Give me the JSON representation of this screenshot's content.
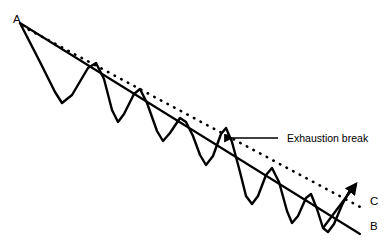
{
  "figure": {
    "kind": "technical-analysis-trendline-diagram",
    "background_color": "#ffffff",
    "stroke_color": "#000000",
    "width": 392,
    "height": 240
  },
  "labels": {
    "apex": "A",
    "trendline_end": "B",
    "parallel_line_end": "C",
    "annotation": "Exhaustion break"
  },
  "chart_data": {
    "type": "line",
    "title": "",
    "xlabel": "",
    "ylabel": "",
    "grid": false,
    "legend": "none",
    "xlim": [
      0,
      392
    ],
    "ylim": [
      0,
      240
    ],
    "series": [
      {
        "name": "price-wave",
        "role": "zigzag price action",
        "style": "solid",
        "points": [
          [
            20,
            23
          ],
          [
            40,
            62
          ],
          [
            55,
            92
          ],
          [
            62,
            103
          ],
          [
            72,
            95
          ],
          [
            88,
            68
          ],
          [
            96,
            63
          ],
          [
            104,
            79
          ],
          [
            112,
            110
          ],
          [
            118,
            122
          ],
          [
            124,
            114
          ],
          [
            134,
            94
          ],
          [
            140,
            89
          ],
          [
            147,
            103
          ],
          [
            157,
            131
          ],
          [
            163,
            141
          ],
          [
            170,
            133
          ],
          [
            180,
            118
          ],
          [
            186,
            122
          ],
          [
            193,
            136
          ],
          [
            200,
            155
          ],
          [
            206,
            165
          ],
          [
            213,
            156
          ],
          [
            221,
            134
          ],
          [
            226,
            128
          ],
          [
            232,
            142
          ],
          [
            240,
            172
          ],
          [
            246,
            196
          ],
          [
            252,
            204
          ],
          [
            258,
            196
          ],
          [
            266,
            175
          ],
          [
            272,
            168
          ],
          [
            279,
            182
          ],
          [
            287,
            211
          ],
          [
            292,
            223
          ],
          [
            298,
            216
          ],
          [
            306,
            198
          ],
          [
            311,
            194
          ],
          [
            317,
            209
          ],
          [
            323,
            228
          ],
          [
            328,
            232
          ],
          [
            334,
            224
          ],
          [
            342,
            205
          ],
          [
            350,
            190
          ]
        ]
      },
      {
        "name": "trendline-AB",
        "role": "descending resistance trendline",
        "style": "solid",
        "points": [
          [
            20,
            23
          ],
          [
            360,
            234
          ]
        ]
      },
      {
        "name": "parallel-line-C",
        "role": "parallel dotted projection line",
        "style": "dotted",
        "points": [
          [
            22,
            26
          ],
          [
            362,
            208
          ]
        ]
      },
      {
        "name": "breakout-arrow",
        "role": "upward breakout arrow",
        "style": "solid-arrow",
        "points": [
          [
            323,
            228
          ],
          [
            356,
            184
          ]
        ]
      },
      {
        "name": "annotation-leader",
        "role": "pointer from label to exhaustion break",
        "style": "solid-arrow",
        "points": [
          [
            278,
            138
          ],
          [
            225,
            138
          ]
        ]
      }
    ],
    "annotations": [
      {
        "text": "A",
        "x": 13,
        "y": 18,
        "anchor": "start"
      },
      {
        "text": "B",
        "x": 370,
        "y": 226,
        "anchor": "start"
      },
      {
        "text": "C",
        "x": 370,
        "y": 201,
        "anchor": "start"
      },
      {
        "text": "Exhaustion break",
        "x": 286,
        "y": 138,
        "anchor": "start"
      }
    ],
    "touch_points": [
      [
        96,
        63
      ],
      [
        140,
        89
      ],
      [
        186,
        122
      ],
      [
        226,
        128
      ],
      [
        272,
        168
      ],
      [
        311,
        194
      ]
    ],
    "break_point": [
      224,
      138
    ]
  }
}
